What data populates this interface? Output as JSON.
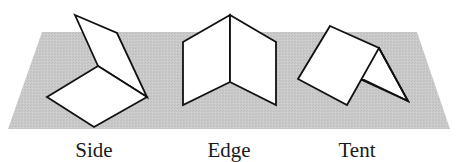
{
  "figure": {
    "plane_color": "#c8c8c8",
    "stroke_color": "#111111",
    "labels": {
      "side": "Side",
      "edge": "Edge",
      "tent": "Tent"
    }
  }
}
